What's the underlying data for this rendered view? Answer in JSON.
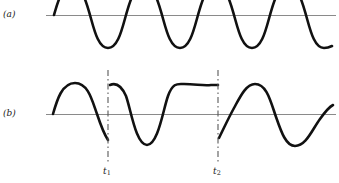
{
  "figure": {
    "title": "",
    "width": 339,
    "height": 183,
    "background": "#ffffff",
    "stroke_color": "#111111",
    "axis_color": "#8a8a8a",
    "marker_color": "#5a5a5a"
  },
  "panels": [
    {
      "id": "a",
      "label": "(a)",
      "description": "continuous sinusoid, no phase discontinuity",
      "axis_y": 15,
      "axis_x_start": 46,
      "axis_x_end": 336,
      "wave_start_x": 54,
      "wave_end_x": 330,
      "amplitude": 33,
      "period": 71,
      "phase_breaks": []
    },
    {
      "id": "b",
      "label": "(b)",
      "description": "sinusoid with abrupt phase reversals at t1 and t2",
      "axis_y": 114,
      "axis_x_start": 46,
      "axis_x_end": 336,
      "wave_start_x": 53,
      "wave_end_x": 333,
      "amplitude": 31,
      "period": 71,
      "phase_breaks": [
        "t1",
        "t2"
      ]
    }
  ],
  "markers": [
    {
      "name": "t1",
      "label": "t",
      "subscript": "1",
      "x": 108,
      "y_top": 70,
      "y_bottom": 164,
      "label_x": 103,
      "label_y": 166
    },
    {
      "name": "t2",
      "label": "t",
      "subscript": "2",
      "x": 218,
      "y_top": 70,
      "y_bottom": 164,
      "label_x": 213,
      "label_y": 166
    }
  ],
  "chart_data": {
    "type": "line",
    "title": "",
    "xlabel": "",
    "ylabel": "",
    "grid": false,
    "legend": "none",
    "axis_ranges": {
      "x": [
        46,
        336
      ],
      "y": [
        -1,
        1
      ]
    },
    "annotations": [
      {
        "text": "(a)",
        "x": 3,
        "y": 9,
        "role": "panel-label"
      },
      {
        "text": "(b)",
        "x": 3,
        "y": 108,
        "role": "panel-label"
      },
      {
        "text": "t1",
        "x": 103,
        "y": 166,
        "role": "time-marker-label"
      },
      {
        "text": "t2",
        "x": 213,
        "y": 166,
        "role": "time-marker-label"
      }
    ],
    "series": [
      {
        "name": "(a) unmodulated carrier",
        "path": "M 54 15 C 58 1 62 -14 72 -14 C 82 -14 86 1 90 15 C 94 29 98 48 108 48 C 118 48 122 29 126 15 C 130 1 134 -14 144 -14 C 154 -14 158 1 162 15 C 166 29 170 48 180 48 C 190 48 194 29 198 15 C 202 1 206 -14 216 -14 C 226 -14 230 1 234 15 C 238 29 242 48 252 48 C 262 48 266 29 270 15 C 274 1 278 -14 288 -14 C 298 -14 302 1 306 15 C 310 29 314 48 324 48 C 328 48 330 47 332 46",
        "segments": 1,
        "continuous": true
      },
      {
        "name": "(b) segment 1 (start to t1)",
        "path": "M 53 114 C 57 100 62 83 75 83 C 88 83 92 100 97 114 C 101 126 104 134 108 140",
        "continuous": false
      },
      {
        "name": "(b) segment 2 (t1 to t2)",
        "path": "M 110 85 C 117 82 122 87 126 96 C 131 110 136 145 147 145 C 158 145 163 110 168 96 C 173 82 178 84 184 84 C 196 84 203 86 211 85 C 214 85 216 85 218 85",
        "continuous": false
      },
      {
        "name": "(b) segment 3 (t2 to end)",
        "path": "M 219 138 C 223 130 228 119 234 108 C 240 97 246 84 255 84 C 266 84 270 99 275 114 C 280 128 285 146 295 146 C 306 146 312 130 320 119 C 325 112 329 107 333 105",
        "continuous": false
      }
    ]
  }
}
